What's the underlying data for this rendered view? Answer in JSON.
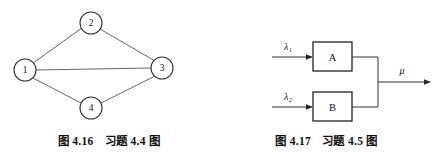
{
  "page": {
    "background_color": "#ffffff",
    "ink_color": "#333333",
    "text_color": "#111111"
  },
  "figures": [
    {
      "id": "figure-left",
      "caption": {
        "number": "图 4.16",
        "title": "习题 4.4 图"
      },
      "diagram": {
        "type": "undirected-graph",
        "nodes": [
          {
            "id": "1",
            "label": "1",
            "cx": 25,
            "cy": 70,
            "r": 11
          },
          {
            "id": "2",
            "label": "2",
            "cx": 91,
            "cy": 23,
            "r": 11
          },
          {
            "id": "3",
            "label": "3",
            "cx": 162,
            "cy": 68,
            "r": 11
          },
          {
            "id": "4",
            "label": "4",
            "cx": 91,
            "cy": 108,
            "r": 11
          }
        ],
        "edges": [
          {
            "from": "1",
            "to": "2"
          },
          {
            "from": "2",
            "to": "3"
          },
          {
            "from": "1",
            "to": "3"
          },
          {
            "from": "1",
            "to": "4"
          },
          {
            "from": "4",
            "to": "3"
          }
        ]
      }
    },
    {
      "id": "figure-right",
      "caption": {
        "number": "图 4.17",
        "title": "习题 4.5 图"
      },
      "diagram": {
        "type": "block-flow",
        "blocks": [
          {
            "id": "A",
            "label": "A",
            "x": 95,
            "y": 42,
            "w": 39,
            "h": 29
          },
          {
            "id": "B",
            "label": "B",
            "x": 95,
            "y": 92,
            "w": 39,
            "h": 29
          }
        ],
        "inputs": [
          {
            "id": "lambda-1",
            "label": "λ₁",
            "target": "A",
            "y": 57,
            "x_start": 54,
            "label_x": 70,
            "label_y": 49
          },
          {
            "id": "lambda-2",
            "label": "λ₂",
            "target": "B",
            "y": 107,
            "x_start": 54,
            "label_x": 70,
            "label_y": 99
          }
        ],
        "output": {
          "id": "mu",
          "label": "μ",
          "y": 82,
          "merge_x": 160,
          "x_end": 212,
          "label_x": 183,
          "label_y": 73
        }
      }
    }
  ]
}
